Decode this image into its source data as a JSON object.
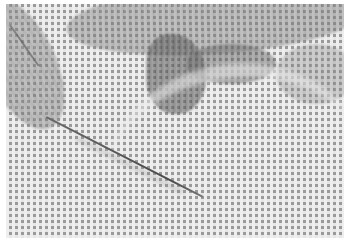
{
  "image": {
    "subject": "needlepoint canvas with needle",
    "description": "Grayscale photograph of an open-weave needlepoint canvas; dark stitched areas in the upper portion and a threaded needle lying diagonally from the upper-left toward the center.",
    "palette": {
      "canvas_light": "#eeeeee",
      "canvas_holes": "#9a9a9a",
      "stitched_dark": "#505050",
      "needle": "#4a4a4a",
      "background": "#ffffff"
    }
  }
}
